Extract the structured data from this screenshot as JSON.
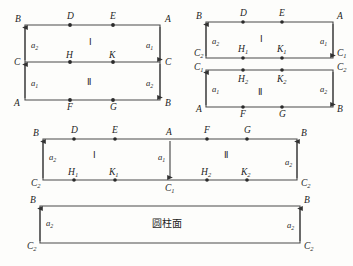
{
  "figure": {
    "stroke_color": "#4a4a4a",
    "vertex_color": "#2a2a2a",
    "background": "#fdfdfb",
    "arrow_labels": {
      "a1": "a",
      "a1_sub": "1",
      "a2": "a",
      "a2_sub": "2"
    },
    "regions": {
      "one": "Ⅰ",
      "two": "Ⅱ"
    },
    "surface_label": "圆柱面"
  },
  "panels": [
    {
      "id": "top-left",
      "name": "rectangle-divided-horizontally",
      "corner_labels": {
        "top_left": "B",
        "top_right": "A",
        "bottom_left": "A",
        "bottom_right": "B",
        "mid_left": "C",
        "mid_right": "C"
      },
      "top_points": [
        {
          "label": "D"
        },
        {
          "label": "E"
        }
      ],
      "mid_points": [
        {
          "label": "H"
        },
        {
          "label": "K"
        }
      ],
      "bottom_points": [
        {
          "label": "F"
        },
        {
          "label": "G"
        }
      ],
      "regions": [
        {
          "label": "Ⅰ"
        },
        {
          "label": "Ⅱ"
        }
      ],
      "edge_arrows": [
        {
          "name": "left-upper",
          "label": "a",
          "sub": "2",
          "direction": "up"
        },
        {
          "name": "left-lower",
          "label": "a",
          "sub": "1",
          "direction": "up"
        },
        {
          "name": "right-upper",
          "label": "a",
          "sub": "1",
          "direction": "down"
        },
        {
          "name": "right-lower",
          "label": "a",
          "sub": "2",
          "direction": "down"
        }
      ]
    },
    {
      "id": "top-right",
      "name": "two-separated-rectangles",
      "upper": {
        "corner_labels": {
          "top_left": "B",
          "top_right": "A",
          "bottom_left": "C",
          "bottom_left_sub": "2",
          "bottom_right": "C",
          "bottom_right_sub": "1"
        },
        "top_points": [
          {
            "label": "D"
          },
          {
            "label": "E"
          }
        ],
        "bottom_points": [
          {
            "label": "H",
            "sub": "1"
          },
          {
            "label": "K",
            "sub": "1"
          }
        ],
        "region": "Ⅰ",
        "left_arrow": {
          "label": "a",
          "sub": "2",
          "direction": "up"
        },
        "right_arrow": {
          "label": "a",
          "sub": "1",
          "direction": "down"
        }
      },
      "lower": {
        "corner_labels": {
          "top_left": "C",
          "top_left_sub": "1",
          "top_right": "C",
          "top_right_sub": "2",
          "bottom_left": "A",
          "bottom_right": "B"
        },
        "top_points": [
          {
            "label": "H",
            "sub": "2"
          },
          {
            "label": "K",
            "sub": "2"
          }
        ],
        "bottom_points": [
          {
            "label": "F"
          },
          {
            "label": "G"
          }
        ],
        "region": "Ⅱ",
        "left_arrow": {
          "label": "a",
          "sub": "1",
          "direction": "up"
        },
        "right_arrow": {
          "label": "a",
          "sub": "2",
          "direction": "down"
        }
      }
    },
    {
      "id": "middle",
      "name": "wide-rectangle-joined",
      "corner_labels": {
        "top_left": "B",
        "top_mid": "A",
        "top_right": "B",
        "bottom_left": "C",
        "bottom_left_sub": "2",
        "bottom_mid": "C",
        "bottom_mid_sub": "1",
        "bottom_right": "C",
        "bottom_right_sub": "2"
      },
      "top_points": [
        {
          "label": "D"
        },
        {
          "label": "E"
        },
        {
          "label": "F"
        },
        {
          "label": "G"
        }
      ],
      "bottom_points": [
        {
          "label": "H",
          "sub": "1"
        },
        {
          "label": "K",
          "sub": "1"
        },
        {
          "label": "H",
          "sub": "2"
        },
        {
          "label": "K",
          "sub": "2"
        }
      ],
      "regions": [
        {
          "label": "Ⅰ"
        },
        {
          "label": "Ⅱ"
        }
      ],
      "edge_arrows": [
        {
          "name": "left",
          "label": "a",
          "sub": "2",
          "direction": "up"
        },
        {
          "name": "center",
          "label": "a",
          "sub": "1",
          "direction": "down"
        },
        {
          "name": "right",
          "label": "a",
          "sub": "2",
          "direction": "up"
        }
      ]
    },
    {
      "id": "bottom",
      "name": "cylinder-surface-rectangle",
      "corner_labels": {
        "top_left": "B",
        "top_right": "B",
        "bottom_left": "C",
        "bottom_left_sub": "2",
        "bottom_right": "C",
        "bottom_right_sub": "2"
      },
      "center_label": "圆柱面",
      "edge_arrows": [
        {
          "name": "left",
          "label": "a",
          "sub": "2",
          "direction": "up"
        },
        {
          "name": "right",
          "label": "a",
          "sub": "2",
          "direction": "up"
        }
      ]
    }
  ]
}
